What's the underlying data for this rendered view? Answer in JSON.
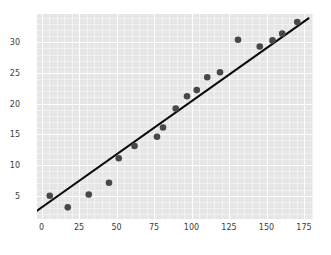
{
  "chart_data": {
    "type": "scatter",
    "title": "",
    "xlabel": "",
    "ylabel": "",
    "xlim": [
      -3,
      181
    ],
    "ylim": [
      1.2,
      34.6
    ],
    "xticks": [
      0,
      25,
      50,
      75,
      100,
      125,
      150,
      175
    ],
    "yticks": [
      5,
      10,
      15,
      20,
      25,
      30
    ],
    "grid": true,
    "legend": "none",
    "background_color": "#e6e6e6",
    "gridline_color": "#ffffff",
    "point_color": "#484848",
    "line_color": "#0a0a0a",
    "series": [
      {
        "name": "observations",
        "marker": "circle",
        "points": [
          {
            "x": 5.5,
            "y": 5.0
          },
          {
            "x": 17.5,
            "y": 3.1
          },
          {
            "x": 31.5,
            "y": 5.2
          },
          {
            "x": 45.0,
            "y": 7.1
          },
          {
            "x": 51.5,
            "y": 11.1
          },
          {
            "x": 62.0,
            "y": 13.1
          },
          {
            "x": 77.0,
            "y": 14.6
          },
          {
            "x": 81.0,
            "y": 16.1
          },
          {
            "x": 89.5,
            "y": 19.2
          },
          {
            "x": 97.0,
            "y": 21.2
          },
          {
            "x": 103.5,
            "y": 22.2
          },
          {
            "x": 110.5,
            "y": 24.3
          },
          {
            "x": 119.0,
            "y": 25.1
          },
          {
            "x": 131.0,
            "y": 30.4
          },
          {
            "x": 145.5,
            "y": 29.3
          },
          {
            "x": 154.0,
            "y": 30.3
          },
          {
            "x": 160.5,
            "y": 31.4
          },
          {
            "x": 170.5,
            "y": 33.3
          }
        ]
      }
    ],
    "trendline": {
      "name": "fit-line",
      "x_start": -3,
      "y_start": 2.55,
      "x_end": 178,
      "y_end": 33.9
    }
  }
}
